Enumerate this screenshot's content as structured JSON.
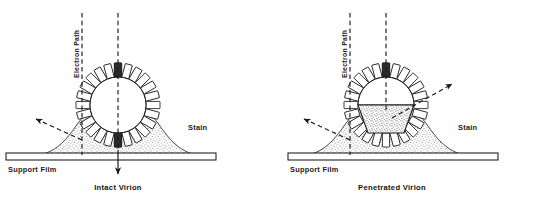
{
  "figure": {
    "background_color": "#ffffff",
    "ink_color": "#1a1a1a",
    "stain_fill_color": "#9a9a9a"
  },
  "panels": [
    {
      "id": "intact",
      "caption": "Intact Virion",
      "electron_path_label": "Electron Path",
      "stain_label": "Stain",
      "support_film_label": "Support Film",
      "spike_count": 24,
      "core_state": "unstained",
      "beam_lines": 2,
      "scatter_arrows": 1
    },
    {
      "id": "penetrated",
      "caption": "Penetrated Virion",
      "electron_path_label": "Electron Path",
      "stain_label": "Stain",
      "support_film_label": "Support Film",
      "spike_count": 24,
      "core_state": "stain-filled",
      "beam_lines": 2,
      "scatter_arrows": 2
    }
  ],
  "legend": {
    "stain": "Stain",
    "support_film": "Support Film",
    "electron_path": "Electron Path"
  }
}
